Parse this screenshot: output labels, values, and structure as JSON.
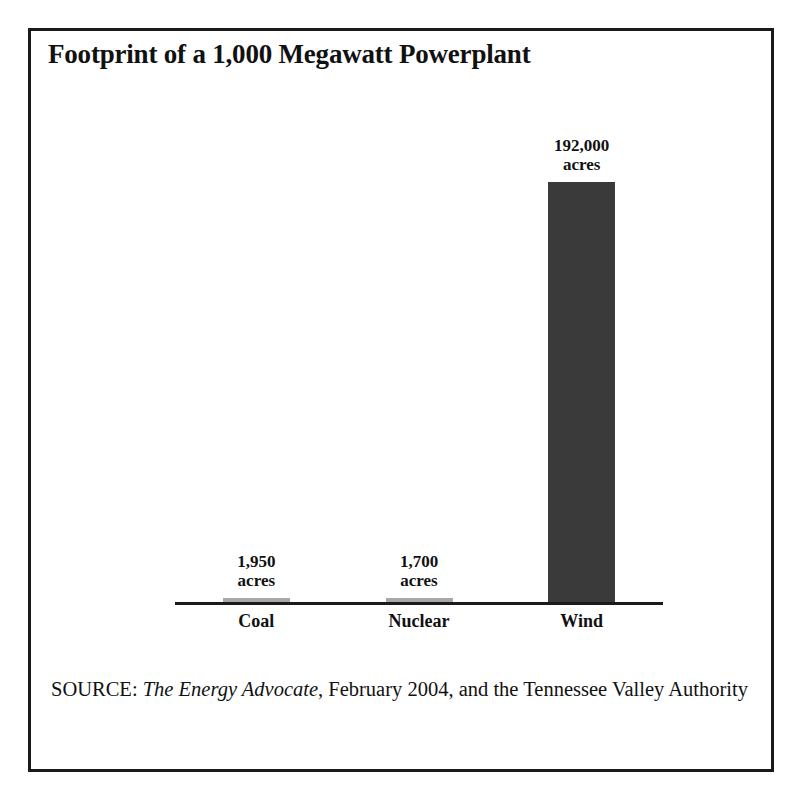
{
  "figure": {
    "title": "Footprint of a 1,000 Megawatt Powerplant",
    "source_prefix": "SOURCE: ",
    "source_italic": "The Energy Advocate",
    "source_rest": ", February 2004, and the Tennessee Valley Authority"
  },
  "chart_data": {
    "type": "bar",
    "title": "Footprint of a 1,000 Megawatt Powerplant",
    "xlabel": "",
    "ylabel": "acres",
    "categories": [
      "Coal",
      "Nuclear",
      "Wind"
    ],
    "values": [
      1950,
      1700,
      192000
    ],
    "value_labels": [
      "1,950\nacres",
      "1,700\nacres",
      "192,000\nacres"
    ],
    "unit": "acres",
    "ylim": [
      0,
      192000
    ],
    "grid": false,
    "legend": false,
    "bar_colors": [
      "#a8a8a8",
      "#a8a8a8",
      "#3a3a3a"
    ]
  }
}
